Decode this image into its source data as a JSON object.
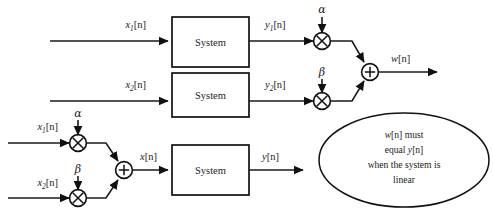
{
  "diagram": {
    "colors": {
      "stroke": "#111111",
      "wire": "#1a1a1a",
      "background": "#ffffff"
    },
    "blocks": {
      "system_top": "System",
      "system_middle": "System",
      "system_bottom": "System"
    },
    "signals": {
      "x1_top_base": "x",
      "x1_top_sub": "1",
      "x1_top_brk": "[n]",
      "x2_mid_base": "x",
      "x2_mid_sub": "2",
      "x2_mid_brk": "[n]",
      "y1_base": "y",
      "y1_sub": "1",
      "y1_brk": "[n]",
      "y2_base": "y",
      "y2_sub": "2",
      "y2_brk": "[n]",
      "w_base": "w",
      "w_brk": "[n]",
      "x1_bot_base": "x",
      "x1_bot_sub": "1",
      "x1_bot_brk": "[n]",
      "x2_bot_base": "x",
      "x2_bot_sub": "2",
      "x2_bot_brk": "[n]",
      "x_sum_base": "x",
      "x_sum_brk": "[n]",
      "y_out_base": "y",
      "y_out_brk": "[n]"
    },
    "gains": {
      "alpha_top": "α",
      "beta_top": "β",
      "alpha_bottom": "α",
      "beta_bottom": "β"
    },
    "operators": {
      "multiply": "×",
      "add": "+"
    },
    "note": {
      "line1_sig": "w",
      "line1_brk": "[n]",
      "line1_text": " must",
      "line2_text": "equal ",
      "line2_sig": "y",
      "line2_brk": "[n]",
      "line3_text": "when the system is",
      "line4_text": "linear"
    }
  }
}
